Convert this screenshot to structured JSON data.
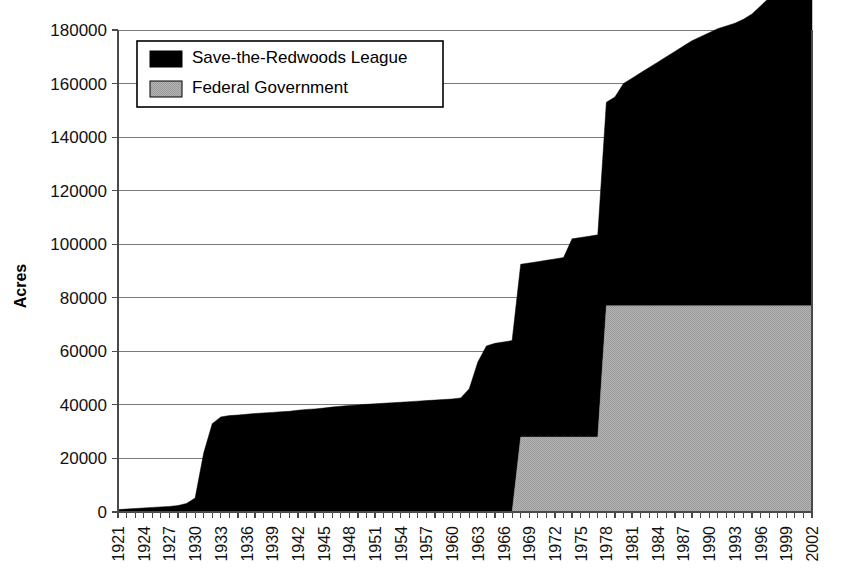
{
  "chart_data": {
    "type": "area",
    "title": "",
    "subtitle": "",
    "xlabel": "",
    "ylabel": "Acres",
    "ylim": [
      0,
      180000
    ],
    "xlim": [
      1921,
      2002
    ],
    "ytick_step": 20000,
    "xtick_step": 3,
    "grid": true,
    "stacked": true,
    "legend_position": "top-left",
    "yticks": [
      0,
      20000,
      40000,
      60000,
      80000,
      100000,
      120000,
      140000,
      160000,
      180000
    ],
    "ytick_labels": [
      "0",
      "20000",
      "40000",
      "60000",
      "80000",
      "100000",
      "120000",
      "140000",
      "160000",
      "180000"
    ],
    "xticks": [
      1921,
      1924,
      1927,
      1930,
      1933,
      1936,
      1939,
      1942,
      1945,
      1948,
      1951,
      1954,
      1957,
      1960,
      1963,
      1966,
      1969,
      1972,
      1975,
      1978,
      1981,
      1984,
      1987,
      1990,
      1993,
      1996,
      1999,
      2002
    ],
    "xtick_labels": [
      "1921",
      "1924",
      "1927",
      "1930",
      "1933",
      "1936",
      "1939",
      "1942",
      "1945",
      "1948",
      "1951",
      "1954",
      "1957",
      "1960",
      "1963",
      "1966",
      "1969",
      "1972",
      "1975",
      "1978",
      "1981",
      "1984",
      "1987",
      "1990",
      "1993",
      "1996",
      "1999",
      "2002"
    ],
    "x": [
      1921,
      1922,
      1923,
      1924,
      1925,
      1926,
      1927,
      1928,
      1929,
      1930,
      1931,
      1932,
      1933,
      1934,
      1935,
      1936,
      1937,
      1938,
      1939,
      1940,
      1941,
      1942,
      1943,
      1944,
      1945,
      1946,
      1947,
      1948,
      1949,
      1950,
      1951,
      1952,
      1953,
      1954,
      1955,
      1956,
      1957,
      1958,
      1959,
      1960,
      1961,
      1962,
      1963,
      1964,
      1965,
      1966,
      1967,
      1968,
      1969,
      1970,
      1971,
      1972,
      1973,
      1974,
      1975,
      1976,
      1977,
      1978,
      1979,
      1980,
      1981,
      1982,
      1983,
      1984,
      1985,
      1986,
      1987,
      1988,
      1989,
      1990,
      1991,
      1992,
      1993,
      1994,
      1995,
      1996,
      1997,
      1998,
      1999,
      2000,
      2001,
      2002
    ],
    "series": [
      {
        "name": "Save-the-Redwoods League",
        "color": "#000000",
        "values": [
          900,
          1100,
          1300,
          1500,
          1700,
          1900,
          2100,
          2400,
          3200,
          5200,
          22000,
          33000,
          35500,
          36000,
          36200,
          36500,
          36800,
          37000,
          37200,
          37400,
          37600,
          38000,
          38300,
          38500,
          38800,
          39200,
          39500,
          39800,
          40000,
          40200,
          40400,
          40600,
          40800,
          41000,
          41200,
          41400,
          41600,
          41800,
          42000,
          42200,
          42600,
          46000,
          56000,
          62000,
          63000,
          63500,
          64000,
          64500,
          65000,
          65500,
          66000,
          66500,
          67000,
          74000,
          74500,
          75000,
          75500,
          76000,
          78000,
          83000,
          85000,
          87000,
          89000,
          91000,
          93000,
          95000,
          97000,
          99000,
          100500,
          102000,
          103500,
          104500,
          105500,
          107000,
          109000,
          112000,
          115000,
          118000,
          121000,
          124000,
          129000,
          163000
        ]
      },
      {
        "name": "Federal Government",
        "color": "#a8a8a8",
        "values": [
          0,
          0,
          0,
          0,
          0,
          0,
          0,
          0,
          0,
          0,
          0,
          0,
          0,
          0,
          0,
          0,
          0,
          0,
          0,
          0,
          0,
          0,
          0,
          0,
          0,
          0,
          0,
          0,
          0,
          0,
          0,
          0,
          0,
          0,
          0,
          0,
          0,
          0,
          0,
          0,
          0,
          0,
          0,
          0,
          0,
          0,
          0,
          28000,
          28000,
          28000,
          28000,
          28000,
          28000,
          28000,
          28000,
          28000,
          28000,
          77000,
          77000,
          77000,
          77000,
          77000,
          77000,
          77000,
          77000,
          77000,
          77000,
          77000,
          77000,
          77000,
          77000,
          77000,
          77000,
          77000,
          77000,
          77000,
          77000,
          77000,
          77000,
          77000,
          77000,
          77000
        ]
      }
    ]
  },
  "legend": {
    "items": [
      {
        "label": "Save-the-Redwoods League",
        "swatch": "black-swatch"
      },
      {
        "label": "Federal Government",
        "swatch": "gray-swatch"
      }
    ]
  },
  "colors": {
    "league": "#000000",
    "federal": "#a8a8a8",
    "grid": "#7a7a7a",
    "axis": "#4a4a4a",
    "background": "#ffffff"
  }
}
